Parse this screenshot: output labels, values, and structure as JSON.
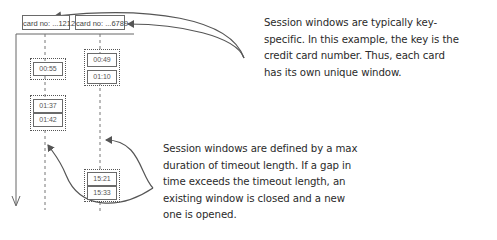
{
  "keys": [
    {
      "label": "card no: ...1212"
    },
    {
      "label": "card no: ...6789"
    }
  ],
  "windows": [
    {
      "key": "card no: ...1212",
      "events": [
        "00:55"
      ]
    },
    {
      "key": "card no: ...1212",
      "events": [
        "01:37",
        "01:42"
      ]
    },
    {
      "key": "card no: ...6789",
      "events": [
        "00:49",
        "01:10"
      ]
    },
    {
      "key": "card no: ...6789",
      "events": [
        "15:21",
        "15:33"
      ]
    }
  ],
  "annotations": {
    "key_note": "Session windows are typically key-\nspecific. In this example, the key is the\ncredit card number. Thus, each card\nhas its own unique window.",
    "timeout_note": "Session windows are defined by a max\nduration of timeout length. If a gap in\ntime exceeds the timeout length, an\nexisting window is closed and a new\none is opened."
  },
  "colors": {
    "line": "#555555",
    "text": "#2a2a2a"
  }
}
